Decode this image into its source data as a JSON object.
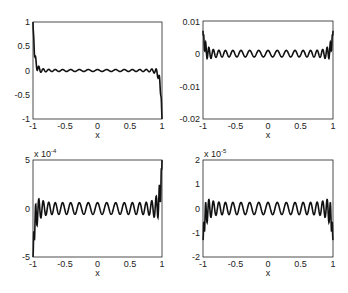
{
  "chart_data": [
    {
      "type": "line",
      "title": "",
      "xlabel": "x",
      "ylabel": "",
      "xlim": [
        -1,
        1
      ],
      "ylim": [
        -1,
        1
      ],
      "xticks": [
        "-1",
        "-0.5",
        "0",
        "0.5",
        "1"
      ],
      "yticks": [
        "-1",
        "-0.5",
        "0",
        "0.5",
        "1"
      ],
      "exponent_label": "",
      "scale": 1,
      "grid": false,
      "series": [
        {
          "name": "error",
          "description": "oscillating curve, spikes to +1 at x=-1 and -1 at x=1, small ripples ~±0.02 in middle, ±0.15 near edges",
          "edge_left": 1.0,
          "edge_right": -1.0,
          "mid_amplitude": 0.02,
          "near_edge_amplitude": 0.17,
          "cycles": 22
        }
      ],
      "box": {
        "left": 33,
        "top": 22,
        "right": 162,
        "bottom": 119
      }
    },
    {
      "type": "line",
      "title": "",
      "xlabel": "x",
      "ylabel": "",
      "xlim": [
        -1,
        1
      ],
      "ylim": [
        -0.02,
        0.01
      ],
      "xticks": [
        "-1",
        "-0.5",
        "0",
        "0.5",
        "1"
      ],
      "yticks": [
        "-0.02",
        "-0.01",
        "0",
        "0.01"
      ],
      "exponent_label": "",
      "scale": 1,
      "grid": false,
      "series": [
        {
          "name": "error",
          "description": "symmetric oscillation, peaks ~0.007 at edges, dips ~-0.004 near edges, mid amplitude ~0.001",
          "edge_left": 0.007,
          "edge_right": 0.007,
          "mid_amplitude": 0.001,
          "near_edge_amplitude": 0.004,
          "cycles": 22
        }
      ],
      "box": {
        "left": 203,
        "top": 21,
        "right": 333,
        "bottom": 119
      }
    },
    {
      "type": "line",
      "title": "",
      "xlabel": "x",
      "ylabel": "",
      "xlim": [
        -1,
        1
      ],
      "ylim": [
        -5,
        5
      ],
      "xticks": [
        "-1",
        "-0.5",
        "0",
        "0.5",
        "1"
      ],
      "yticks": [
        "-5",
        "0",
        "5"
      ],
      "exponent_label": "x 10^-4",
      "scale": 0.0001,
      "grid": false,
      "series": [
        {
          "name": "error",
          "description": "antisymmetric oscillation, -5e-4 at x=-1, +5e-4 at x=1, near-edge peaks ~±2.7e-4, mid amplitude ~0.6e-4",
          "edge_left": -5.0,
          "edge_right": 5.0,
          "mid_amplitude": 0.6,
          "near_edge_amplitude": 2.7,
          "cycles": 22
        }
      ],
      "box": {
        "left": 33,
        "top": 160,
        "right": 162,
        "bottom": 257
      }
    },
    {
      "type": "line",
      "title": "",
      "xlabel": "x",
      "ylabel": "",
      "xlim": [
        -1,
        1
      ],
      "ylim": [
        -2,
        2
      ],
      "xticks": [
        "-1",
        "-0.5",
        "0",
        "0.5",
        "1"
      ],
      "yticks": [
        "-2",
        "-1",
        "0",
        "1",
        "2"
      ],
      "exponent_label": "x 10^-5",
      "scale": 1e-05,
      "grid": false,
      "series": [
        {
          "name": "error",
          "description": "symmetric oscillation, peaks ~0.9e-5 and dips ~-1.3e-5 near edges, mid amplitude ~0.25e-5",
          "edge_left": -1.3,
          "edge_right": -1.3,
          "mid_amplitude": 0.25,
          "near_edge_amplitude": 0.9,
          "cycles": 22
        }
      ],
      "box": {
        "left": 203,
        "top": 160,
        "right": 333,
        "bottom": 257
      }
    }
  ],
  "labels": {
    "p1": {
      "xlabel": "x",
      "yticks": [
        "1",
        "0.5",
        "0",
        "-0.5",
        "-1"
      ],
      "xticks": [
        "-1",
        "-0.5",
        "0",
        "0.5",
        "1"
      ],
      "exp": ""
    },
    "p2": {
      "xlabel": "x",
      "yticks": [
        "0.01",
        "0",
        "-0.01",
        "-0.02"
      ],
      "xticks": [
        "-1",
        "-0.5",
        "0",
        "0.5",
        "1"
      ],
      "exp": ""
    },
    "p3": {
      "xlabel": "x",
      "yticks": [
        "5",
        "0",
        "-5"
      ],
      "xticks": [
        "-1",
        "-0.5",
        "0",
        "0.5",
        "1"
      ],
      "exp_base": "x 10",
      "exp_power": "-4"
    },
    "p4": {
      "xlabel": "x",
      "yticks": [
        "2",
        "1",
        "0",
        "-1",
        "-2"
      ],
      "xticks": [
        "-1",
        "-0.5",
        "0",
        "0.5",
        "1"
      ],
      "exp_base": "x 10",
      "exp_power": "-5"
    }
  }
}
